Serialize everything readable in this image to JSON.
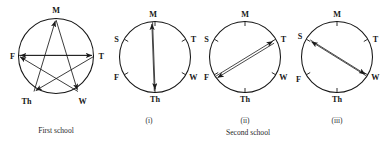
{
  "figure": {
    "title_first": "First school",
    "title_second": "Second school",
    "panel_labels": [
      "(i)",
      "(ii)",
      "(iii)"
    ],
    "line_color": "#1a1a1a",
    "background_color": "#ffffff"
  },
  "first_school": {
    "caption": "First school",
    "shape": "pentagram-in-circle",
    "vertices": [
      {
        "key": "M",
        "label": "M",
        "position": "top"
      },
      {
        "key": "T",
        "label": "T",
        "position": "right"
      },
      {
        "key": "W",
        "label": "W",
        "position": "bottom-right"
      },
      {
        "key": "Th",
        "label": "Th",
        "position": "bottom-left"
      },
      {
        "key": "F",
        "label": "F",
        "position": "left"
      }
    ],
    "arrows": [
      {
        "from": "M",
        "to": "W"
      },
      {
        "from": "W",
        "to": "F"
      },
      {
        "from": "F",
        "to": "T"
      },
      {
        "from": "T",
        "to": "Th"
      },
      {
        "from": "Th",
        "to": "M"
      }
    ]
  },
  "second_school": {
    "caption": "Second school",
    "panels": [
      {
        "label": "(i)",
        "vertices": [
          {
            "key": "M",
            "label": "M",
            "position": "top"
          },
          {
            "key": "S",
            "label": "S",
            "position": "upper-left"
          },
          {
            "key": "T",
            "label": "T",
            "position": "upper-right"
          },
          {
            "key": "F",
            "label": "F",
            "position": "lower-left"
          },
          {
            "key": "W",
            "label": "W",
            "position": "lower-right"
          },
          {
            "key": "Th",
            "label": "Th",
            "position": "bottom"
          }
        ],
        "chord": {
          "from": "M",
          "to": "Th",
          "double_headed": true,
          "parallel_lines": 2
        }
      },
      {
        "label": "(ii)",
        "vertices": [
          {
            "key": "M",
            "label": "M",
            "position": "top"
          },
          {
            "key": "S",
            "label": "S",
            "position": "upper-left"
          },
          {
            "key": "T",
            "label": "T",
            "position": "upper-right"
          },
          {
            "key": "F",
            "label": "F",
            "position": "lower-left"
          },
          {
            "key": "W",
            "label": "W",
            "position": "lower-right"
          },
          {
            "key": "Th",
            "label": "Th",
            "position": "bottom"
          }
        ],
        "chord": {
          "from": "F",
          "to": "T",
          "double_headed": true,
          "parallel_lines": 2
        }
      },
      {
        "label": "(iii)",
        "vertices": [
          {
            "key": "M",
            "label": "M",
            "position": "top"
          },
          {
            "key": "S",
            "label": "S",
            "position": "upper-left"
          },
          {
            "key": "T",
            "label": "T",
            "position": "upper-right"
          },
          {
            "key": "F",
            "label": "F",
            "position": "lower-left"
          },
          {
            "key": "W",
            "label": "W",
            "position": "lower-right"
          },
          {
            "key": "Th",
            "label": "Th",
            "position": "bottom"
          }
        ],
        "chord": {
          "from": "S",
          "to": "W",
          "double_headed": true,
          "parallel_lines": 2
        }
      }
    ]
  }
}
